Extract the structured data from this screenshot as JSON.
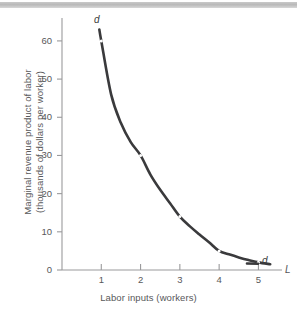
{
  "figure": {
    "top_rule": "decorative-gray-rule"
  },
  "chart_data": {
    "type": "line",
    "title": "",
    "subtitle": "",
    "xlabel": "Labor inputs (workers)",
    "ylabel_line1": "Marginal revenue product of labor",
    "ylabel_line2": "(thousands of dollars per worker)",
    "axis_letter_x": "L",
    "curve_label_top": "d",
    "curve_label_bottom": "d",
    "series_name": "d",
    "x": [
      1,
      2,
      3,
      4,
      5
    ],
    "values": [
      60,
      30,
      14,
      5,
      2
    ],
    "curve_x": [
      0.95,
      1.0,
      1.25,
      1.5,
      1.75,
      2.0,
      2.25,
      2.5,
      2.75,
      3.0,
      3.25,
      3.5,
      3.75,
      4.0,
      4.25,
      4.5,
      4.75,
      5.0,
      5.3
    ],
    "curve_y": [
      63,
      60,
      46,
      38.5,
      33.5,
      30,
      25,
      21,
      17.5,
      14,
      11.5,
      9.3,
      7.2,
      5.0,
      4.1,
      3.3,
      2.6,
      2.0,
      1.5
    ],
    "xticks": [
      "1",
      "2",
      "3",
      "4",
      "5"
    ],
    "xtick_values": [
      1,
      2,
      3,
      4,
      5
    ],
    "yticks": [
      "0",
      "10",
      "20",
      "30",
      "40",
      "50",
      "60"
    ],
    "ytick_values": [
      0,
      10,
      20,
      30,
      40,
      50,
      60
    ],
    "xlim": [
      0,
      5.6
    ],
    "ylim": [
      0,
      66
    ],
    "grid": false,
    "legend": "none",
    "curve_color": "#3a3a3c",
    "axis_color": "#9a9a9c",
    "text_color": "#58585a"
  }
}
